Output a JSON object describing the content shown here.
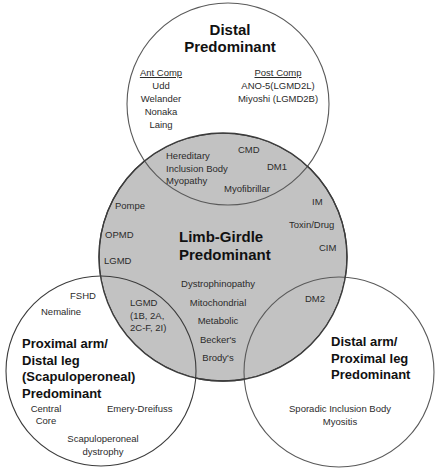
{
  "colors": {
    "center_fill": "#c2c2c2",
    "outline": "#3c3c3c",
    "outer_fill": "#ffffff"
  },
  "circles": {
    "top": {
      "title": [
        "Distal",
        "Predominant"
      ],
      "ant_comp": {
        "header": "Ant Comp",
        "items": [
          "Udd",
          "Welander",
          "Nonaka",
          "Laing"
        ]
      },
      "post_comp": {
        "header": "Post Comp",
        "items": [
          "ANO-5(LGMD2L)",
          "Miyoshi (LGMD2B)"
        ]
      }
    },
    "center": {
      "title": [
        "Limb-Girdle",
        "Predominant"
      ],
      "items_left": [
        "Pompe",
        "OPMD",
        "LGMD"
      ],
      "items_right": [
        "IM",
        "Toxin/Drug",
        "CIM"
      ],
      "items_bottom": [
        "Dystrophinopathy",
        "Mitochondrial",
        "Metabolic",
        "Becker's",
        "Brody's"
      ]
    },
    "left": {
      "title": [
        "Proximal arm/",
        "Distal leg",
        "(Scapuloperoneal)",
        "Predominant"
      ],
      "items": [
        "FSHD",
        "Nemaline",
        "Central Core",
        "Emery-Dreifuss",
        "Scapuloperoneal dystrophy"
      ]
    },
    "right": {
      "title": [
        "Distal arm/",
        "Proximal leg",
        "Predominant"
      ],
      "items": [
        "Sporadic Inclusion Body Myositis"
      ]
    }
  },
  "overlaps": {
    "top_center": [
      "Hereditary Inclusion Body Myopathy",
      "CMD",
      "DM1",
      "Myofibrillar"
    ],
    "left_center": [
      "LGMD",
      "(1B, 2A,",
      "2C-F, 2I)"
    ],
    "right_center": [
      "DM2"
    ]
  }
}
